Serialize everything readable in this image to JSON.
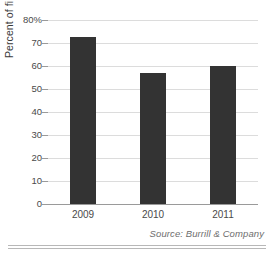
{
  "chart_data": {
    "type": "bar",
    "title": "",
    "xlabel": "",
    "ylabel": "Percent of financings",
    "categories": [
      "2009",
      "2010",
      "2011"
    ],
    "values": [
      72.5,
      57,
      60
    ],
    "ylim": [
      0,
      80
    ],
    "ytick_labels": [
      "80%",
      "70",
      "60",
      "50",
      "40",
      "30",
      "20",
      "10",
      "0"
    ],
    "ytick_values": [
      80,
      70,
      60,
      50,
      40,
      30,
      20,
      10,
      0
    ],
    "grid": true,
    "legend": "none",
    "bar_color": "#333333",
    "gridline_color": "#dcdcdc",
    "axis_color": "#9a9a9a"
  },
  "source_note": "Source: Burrill & Company"
}
